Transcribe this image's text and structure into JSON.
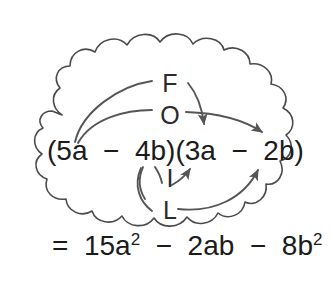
{
  "figure": {
    "border_style": "cloud-scalloped",
    "colors": {
      "text": "#1b1b1b",
      "foil_letter": "#2b2b2b",
      "arrow": "#555555",
      "border": "#4a4a4a",
      "background": "#ffffff"
    }
  },
  "foil": {
    "f": "F",
    "o": "O",
    "i": "I",
    "l": "L"
  },
  "expression": {
    "product": {
      "full": "(5a  −  4b)(3a  −  2b)",
      "left_factor": "(5a − 4b)",
      "right_factor": "(3a − 2b)",
      "terms": [
        "5a",
        "−",
        "4b",
        "3a",
        "−",
        "2b"
      ]
    },
    "result": {
      "equals": "=",
      "term1_coefficient": "15",
      "term1_base": "a",
      "term1_exponent": "2",
      "op1": "−",
      "term2": "2ab",
      "op2": "−",
      "term3_coefficient": "8",
      "term3_base": "b",
      "term3_exponent": "2",
      "plain": "= 15a2 − 2ab − 8b2"
    }
  },
  "arrows": [
    {
      "name": "first-arrow",
      "label": "F",
      "from": "5a",
      "to": "3a"
    },
    {
      "name": "outer-arrow",
      "label": "O",
      "from": "5a",
      "to": "2b"
    },
    {
      "name": "inner-arrow",
      "label": "I",
      "from": "4b",
      "to": "3a"
    },
    {
      "name": "last-arrow",
      "label": "L",
      "from": "4b",
      "to": "2b"
    }
  ]
}
